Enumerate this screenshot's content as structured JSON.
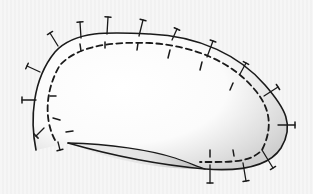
{
  "diagram": {
    "title": "",
    "colors": {
      "background": "#f4f4f4",
      "ink": "#1a1a1a",
      "fill": "#ffffff",
      "shade": "#c8c8c8"
    },
    "outer_outline": "M 36 150 C 30 120, 32 80, 55 52 C 75 30, 110 32, 150 34 C 200 36, 240 56, 265 85 C 285 108, 295 125, 281 148 C 270 165, 245 172, 205 169 C 160 165, 110 155, 68 143",
    "lens_bottom": "M 68 143 C 110 160, 160 170, 205 169",
    "lens_top": "M 68 143 C 110 144, 150 150, 175 158 C 190 163, 198 167, 205 169",
    "dashed_inner": "M 55 140 C 44 120, 45 90, 60 65 C 80 44, 115 42, 150 43 C 195 46, 232 62, 255 90 C 272 110, 272 130, 262 150 C 250 163, 230 162, 200 162",
    "pins": [
      {
        "x1": 40,
        "y1": 72,
        "x2": 27,
        "y2": 66,
        "label": "pin-1"
      },
      {
        "x1": 36,
        "y1": 100,
        "x2": 22,
        "y2": 100,
        "label": "pin-2"
      },
      {
        "x1": 44,
        "y1": 128,
        "x2": 36,
        "y2": 136,
        "label": "pin-3"
      },
      {
        "x1": 58,
        "y1": 142,
        "x2": 60,
        "y2": 150,
        "label": "pin-4"
      },
      {
        "x1": 58,
        "y1": 46,
        "x2": 50,
        "y2": 33,
        "label": "pin-5"
      },
      {
        "x1": 81,
        "y1": 38,
        "x2": 80,
        "y2": 22,
        "label": "pin-6"
      },
      {
        "x1": 107,
        "y1": 34,
        "x2": 108,
        "y2": 17,
        "label": "pin-7"
      },
      {
        "x1": 139,
        "y1": 36,
        "x2": 143,
        "y2": 20,
        "label": "pin-8"
      },
      {
        "x1": 172,
        "y1": 40,
        "x2": 177,
        "y2": 29,
        "label": "pin-9"
      },
      {
        "x1": 207,
        "y1": 57,
        "x2": 213,
        "y2": 41,
        "label": "pin-10"
      },
      {
        "x1": 240,
        "y1": 74,
        "x2": 246,
        "y2": 63,
        "label": "pin-11"
      },
      {
        "x1": 264,
        "y1": 96,
        "x2": 278,
        "y2": 87,
        "label": "pin-12"
      },
      {
        "x1": 278,
        "y1": 125,
        "x2": 295,
        "y2": 125,
        "label": "pin-13"
      },
      {
        "x1": 262,
        "y1": 150,
        "x2": 273,
        "y2": 168,
        "label": "pin-14"
      },
      {
        "x1": 243,
        "y1": 163,
        "x2": 246,
        "y2": 181,
        "label": "pin-15"
      },
      {
        "x1": 210,
        "y1": 165,
        "x2": 210,
        "y2": 183,
        "label": "pin-16"
      }
    ],
    "inner_ticks": [
      {
        "x1": 80,
        "y1": 44,
        "x2": 81,
        "y2": 51
      },
      {
        "x1": 105,
        "y1": 42,
        "x2": 105,
        "y2": 48
      },
      {
        "x1": 138,
        "y1": 43,
        "x2": 137,
        "y2": 50
      },
      {
        "x1": 170,
        "y1": 50,
        "x2": 168,
        "y2": 58
      },
      {
        "x1": 202,
        "y1": 62,
        "x2": 200,
        "y2": 70
      },
      {
        "x1": 233,
        "y1": 83,
        "x2": 230,
        "y2": 90
      },
      {
        "x1": 50,
        "y1": 96,
        "x2": 56,
        "y2": 96
      },
      {
        "x1": 53,
        "y1": 118,
        "x2": 60,
        "y2": 120
      },
      {
        "x1": 66,
        "y1": 132,
        "x2": 73,
        "y2": 131
      },
      {
        "x1": 210,
        "y1": 150,
        "x2": 210,
        "y2": 157
      },
      {
        "x1": 233,
        "y1": 150,
        "x2": 234,
        "y2": 156
      }
    ]
  }
}
